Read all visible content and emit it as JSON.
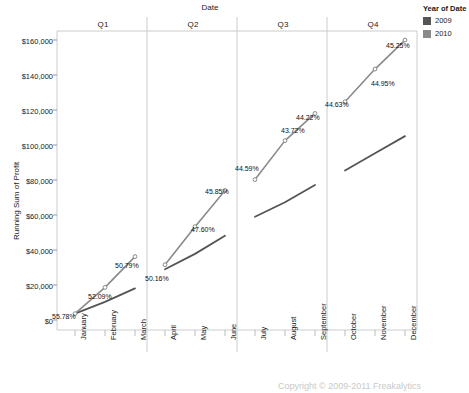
{
  "chart_data": {
    "type": "line",
    "title": "",
    "xlabel": "Date",
    "ylabel": "Running Sum of Profit",
    "ylim": [
      0,
      165000
    ],
    "yticks": [
      "$0",
      "$20,000",
      "$40,000",
      "$60,000",
      "$80,000",
      "$100,000",
      "$120,000",
      "$140,000",
      "$160,000"
    ],
    "ytick_values": [
      0,
      20000,
      40000,
      60000,
      80000,
      100000,
      120000,
      140000,
      160000
    ],
    "grid": false,
    "legend_position": "top-right",
    "panels": [
      "Q1",
      "Q2",
      "Q3",
      "Q4"
    ],
    "categories": [
      "January",
      "February",
      "March",
      "April",
      "May",
      "June",
      "July",
      "August",
      "September",
      "October",
      "November",
      "December"
    ],
    "series": [
      {
        "name": "2009",
        "color": "#555555",
        "values": [
          9000,
          15500,
          23000,
          33500,
          42000,
          52000,
          62500,
          70500,
          80000,
          88000,
          97500,
          107000
        ],
        "labels": []
      },
      {
        "name": "2010",
        "color": "#8a8a8a",
        "values": [
          9000,
          23500,
          40500,
          36000,
          57000,
          77000,
          83000,
          104500,
          119500,
          126000,
          144000,
          160000
        ],
        "labels": [
          "55.78%",
          "52.09%",
          "50.79%",
          "50.16%",
          "47.60%",
          "45.85%",
          "44.59%",
          "43.72%",
          "44.22%",
          "44.63%",
          "44.95%",
          "45.25%"
        ]
      }
    ]
  },
  "legend": {
    "title": "Year of Date",
    "entries": [
      {
        "label": "2009",
        "color": "#555555"
      },
      {
        "label": "2010",
        "color": "#8a8a8a"
      }
    ]
  },
  "footer": {
    "text": "Copyright © 2009-2011 Freakalytics"
  }
}
